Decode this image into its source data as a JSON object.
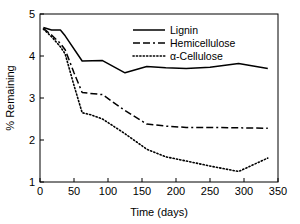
{
  "chart_data": {
    "type": "line",
    "title": "",
    "subtitle": "",
    "xlabel": "Time (days)",
    "ylabel": "% Remaining",
    "xlim": [
      0,
      350
    ],
    "ylim": [
      1,
      5
    ],
    "xticks": [
      0,
      50,
      100,
      150,
      200,
      250,
      300,
      350
    ],
    "yticks": [
      1,
      2,
      3,
      4,
      5
    ],
    "xtick_labels": [
      "0",
      "50",
      "100",
      "150",
      "200",
      "250",
      "300",
      "350"
    ],
    "ytick_labels": [
      "1",
      "2",
      "3",
      "4",
      "5"
    ],
    "grid": false,
    "legend_position": "top-center",
    "series": [
      {
        "name": "Lignin",
        "style": "solid",
        "color": "#000000",
        "x": [
          5,
          17,
          30,
          37,
          62,
          92,
          125,
          157,
          185,
          215,
          250,
          292,
          335
        ],
        "values": [
          4.68,
          4.62,
          4.62,
          4.48,
          3.88,
          3.89,
          3.6,
          3.75,
          3.72,
          3.7,
          3.73,
          3.82,
          3.7
        ]
      },
      {
        "name": "Hemicellulose",
        "style": "dashed",
        "color": "#000000",
        "x": [
          5,
          17,
          30,
          37,
          50,
          62,
          92,
          125,
          157,
          185,
          215,
          250,
          292,
          335
        ],
        "values": [
          4.66,
          4.5,
          4.3,
          4.15,
          3.6,
          3.13,
          3.08,
          2.7,
          2.38,
          2.33,
          2.3,
          2.3,
          2.29,
          2.28
        ]
      },
      {
        "name": "α-Cellulose",
        "style": "dotted",
        "color": "#000000",
        "x": [
          5,
          17,
          30,
          37,
          50,
          62,
          75,
          92,
          125,
          157,
          185,
          215,
          250,
          292,
          335
        ],
        "values": [
          4.64,
          4.46,
          4.22,
          4.05,
          3.3,
          2.65,
          2.6,
          2.5,
          2.15,
          1.78,
          1.6,
          1.5,
          1.38,
          1.25,
          1.57
        ]
      }
    ]
  },
  "legend": {
    "entries": [
      {
        "label": "Lignin",
        "style": "solid"
      },
      {
        "label": "Hemicellulose",
        "style": "dashed"
      },
      {
        "label": "α-Cellulose",
        "style": "dotted"
      }
    ]
  },
  "axes": {
    "x_title": "Time (days)",
    "y_title": "% Remaining"
  }
}
